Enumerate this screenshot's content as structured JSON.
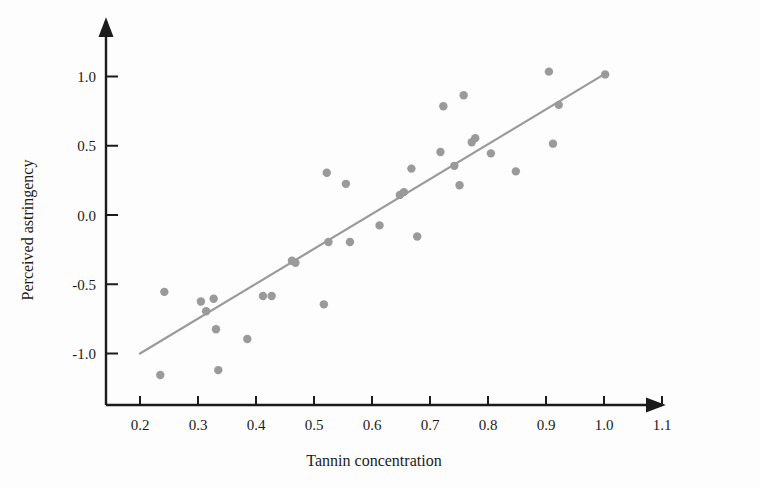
{
  "chart_data": {
    "type": "scatter",
    "title": "",
    "xlabel": "Tannin concentration",
    "ylabel": "Perceived astringency",
    "xlim": [
      0.155,
      1.155
    ],
    "ylim": [
      -1.25,
      1.15
    ],
    "xticks": [
      0.2,
      0.3,
      0.4,
      0.5,
      0.6,
      0.7,
      0.8,
      0.9,
      1.0,
      1.1
    ],
    "xtick_labels": [
      "0.2",
      "0.3",
      "0.4",
      "0.5",
      "0.6",
      "0.7",
      "0.8",
      "0.9",
      "1.0",
      "1.1"
    ],
    "yticks": [
      -1.0,
      -0.5,
      0.0,
      0.5,
      1.0
    ],
    "ytick_labels": [
      "-1.0",
      "-0.5",
      "0.0",
      "0.5",
      "1.0"
    ],
    "grid": false,
    "legend": null,
    "point_color": "#9a9a9a",
    "line_color": "#9a9a9a",
    "axis_color": "#1b1b1b",
    "marker_radius": 4.2,
    "points": [
      {
        "x": 0.235,
        "y": -1.155
      },
      {
        "x": 0.242,
        "y": -0.555
      },
      {
        "x": 0.305,
        "y": -0.625
      },
      {
        "x": 0.314,
        "y": -0.695
      },
      {
        "x": 0.327,
        "y": -0.605
      },
      {
        "x": 0.331,
        "y": -0.825
      },
      {
        "x": 0.335,
        "y": -1.12
      },
      {
        "x": 0.385,
        "y": -0.895
      },
      {
        "x": 0.412,
        "y": -0.585
      },
      {
        "x": 0.427,
        "y": -0.585
      },
      {
        "x": 0.462,
        "y": -0.33
      },
      {
        "x": 0.468,
        "y": -0.345
      },
      {
        "x": 0.517,
        "y": -0.645
      },
      {
        "x": 0.522,
        "y": 0.305
      },
      {
        "x": 0.525,
        "y": -0.195
      },
      {
        "x": 0.555,
        "y": 0.225
      },
      {
        "x": 0.562,
        "y": -0.195
      },
      {
        "x": 0.613,
        "y": -0.075
      },
      {
        "x": 0.648,
        "y": 0.145
      },
      {
        "x": 0.655,
        "y": 0.165
      },
      {
        "x": 0.668,
        "y": 0.335
      },
      {
        "x": 0.678,
        "y": -0.155
      },
      {
        "x": 0.718,
        "y": 0.455
      },
      {
        "x": 0.723,
        "y": 0.785
      },
      {
        "x": 0.742,
        "y": 0.355
      },
      {
        "x": 0.751,
        "y": 0.215
      },
      {
        "x": 0.758,
        "y": 0.865
      },
      {
        "x": 0.772,
        "y": 0.525
      },
      {
        "x": 0.778,
        "y": 0.555
      },
      {
        "x": 0.805,
        "y": 0.445
      },
      {
        "x": 0.848,
        "y": 0.315
      },
      {
        "x": 0.905,
        "y": 1.035
      },
      {
        "x": 0.912,
        "y": 0.515
      },
      {
        "x": 0.922,
        "y": 0.795
      },
      {
        "x": 1.002,
        "y": 1.015
      }
    ],
    "fit_line": {
      "kind": "linear-regression",
      "x_start": 0.2,
      "y_start": -1.0,
      "x_end": 1.0,
      "y_end": 1.015
    }
  }
}
